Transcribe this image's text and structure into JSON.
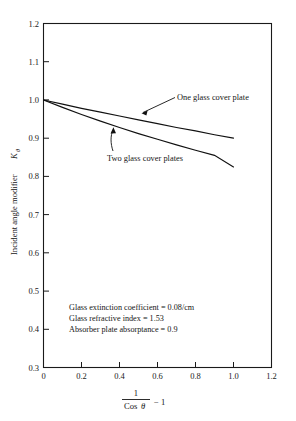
{
  "chart_data": {
    "type": "line",
    "title": "",
    "xlabel": "1 / Cos θ − 1",
    "ylabel": "Incident angle modifier Kθ",
    "xlim": [
      0,
      1.2
    ],
    "ylim": [
      0.3,
      1.2
    ],
    "grid": false,
    "legend_position": "inline-annotations",
    "xticks": [
      "0",
      "0.2",
      "0.4",
      "0.6",
      "0.8",
      "1.0",
      "1.2"
    ],
    "xtick_values": [
      0,
      0.2,
      0.4,
      0.6,
      0.8,
      1.0,
      1.2
    ],
    "yticks": [
      "0.3",
      "0.4",
      "0.5",
      "0.6",
      "0.7",
      "0.8",
      "0.9",
      "1.0",
      "1.1",
      "1.2"
    ],
    "ytick_values": [
      0.3,
      0.4,
      0.5,
      0.6,
      0.7,
      0.8,
      0.9,
      1.0,
      1.1,
      1.2
    ],
    "x": [
      0,
      0.1,
      0.2,
      0.3,
      0.4,
      0.5,
      0.6,
      0.7,
      0.8,
      0.9,
      1.0
    ],
    "series": [
      {
        "name": "One glass cover plate",
        "values": [
          1.0,
          0.989,
          0.978,
          0.968,
          0.958,
          0.948,
          0.938,
          0.928,
          0.919,
          0.909,
          0.9
        ]
      },
      {
        "name": "Two glass cover plates",
        "values": [
          1.0,
          0.9805,
          0.962,
          0.9445,
          0.928,
          0.912,
          0.897,
          0.8825,
          0.8685,
          0.855,
          0.8245
        ]
      }
    ],
    "annotations": [
      "Glass extinction coefficient = 0.08/cm",
      "Glass refractive index = 1.53",
      "Absorber plate absorptance = 0.9"
    ]
  },
  "axis": {
    "x_numerator": "1",
    "x_denominator_word": "Cos",
    "x_denominator_symbol": "θ",
    "x_suffix": "− 1",
    "y_title_main": "Incident angle modifier",
    "y_title_symbol": "K",
    "y_title_subscript": "θ"
  },
  "labels": {
    "series_one": "One glass cover plate",
    "series_two": "Two glass cover plates",
    "annotation_1": "Glass extinction coefficient = 0.08/cm",
    "annotation_2": "Glass refractive index = 1.53",
    "annotation_3": "Absorber plate absorptance = 0.9"
  },
  "colors": {
    "background": "#ffffff",
    "axis": "#1a1a1a",
    "curve": "#111111",
    "text": "#151515"
  }
}
